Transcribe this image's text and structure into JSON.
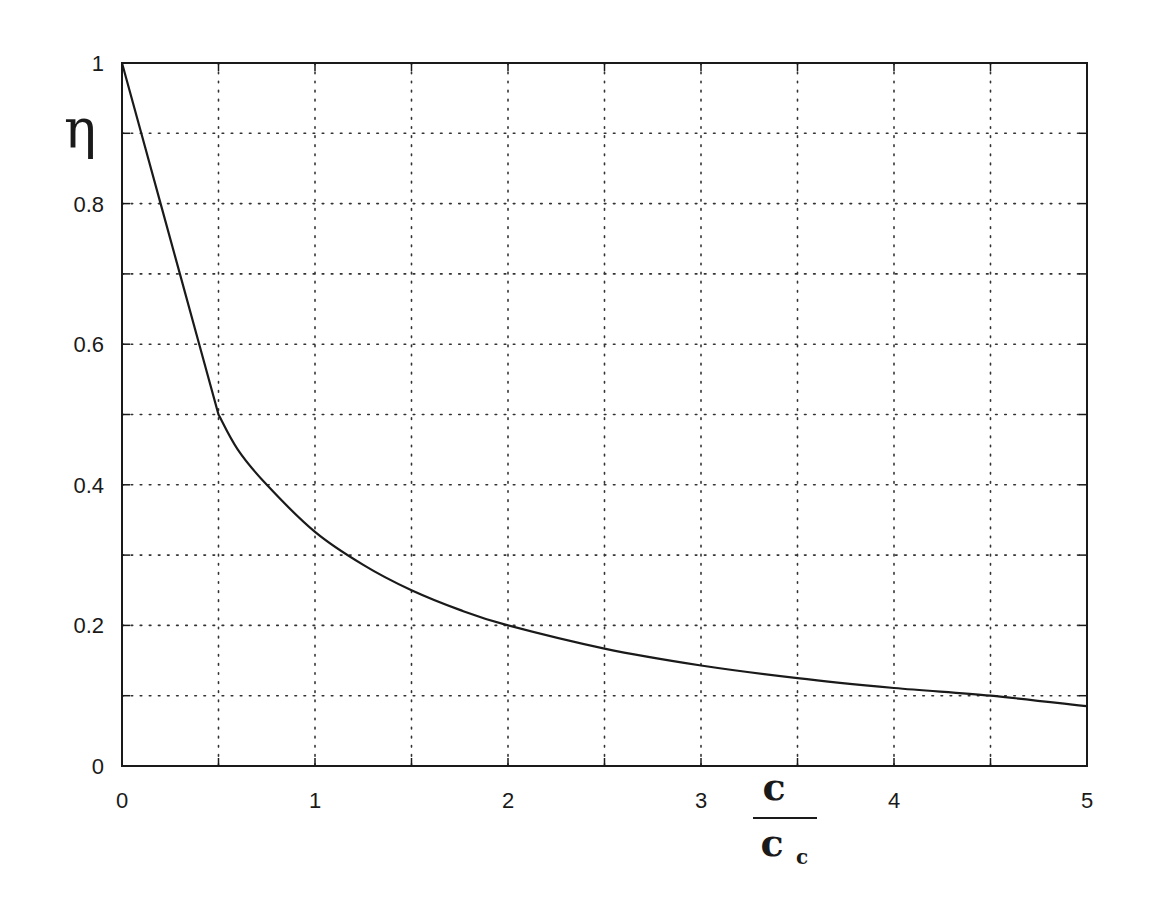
{
  "chart_data": {
    "type": "line",
    "title": "",
    "xlabel": "c / c_c",
    "xlabel_numerator": "c",
    "xlabel_denominator": "c",
    "xlabel_denominator_subscript": "c",
    "ylabel": "η",
    "xlim": [
      0,
      5
    ],
    "ylim": [
      0,
      1
    ],
    "grid": true,
    "grid_style": "dotted",
    "x_ticks": [
      0,
      1,
      2,
      3,
      4,
      5
    ],
    "x_tick_labels": [
      "0",
      "1",
      "2",
      "3",
      "4",
      "5"
    ],
    "x_minor_grid": [
      0.5,
      1.5,
      2.5,
      3.5,
      4.5
    ],
    "y_ticks": [
      0,
      0.2,
      0.4,
      0.6,
      0.8,
      1
    ],
    "y_tick_labels": [
      "0",
      "0.2",
      "0.4",
      "0.6",
      "0.8",
      "1"
    ],
    "y_minor_grid": [
      0.1,
      0.3,
      0.5,
      0.7,
      0.9
    ],
    "series": [
      {
        "name": "η",
        "x": [
          0,
          0.1,
          0.2,
          0.3,
          0.4,
          0.5,
          0.6,
          0.75,
          1.0,
          1.25,
          1.5,
          1.75,
          2.0,
          2.5,
          3.0,
          3.5,
          4.0,
          4.5,
          5.0
        ],
        "values": [
          1.0,
          0.9,
          0.8,
          0.7,
          0.6,
          0.5,
          0.45,
          0.4,
          0.333,
          0.286,
          0.25,
          0.222,
          0.2,
          0.167,
          0.143,
          0.125,
          0.111,
          0.1,
          0.085
        ]
      }
    ],
    "colors": {
      "line": "#1a1a1a",
      "grid": "#333333",
      "frame": "#1a1a1a"
    }
  }
}
